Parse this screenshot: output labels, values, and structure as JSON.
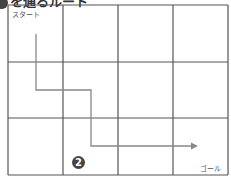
{
  "heading": {
    "text": "を通るルート"
  },
  "grid": {
    "cols": 4,
    "rows": 3,
    "x": [
      8,
      63,
      118,
      173,
      228
    ],
    "y": [
      5,
      62,
      118,
      175
    ],
    "line_color": "#555555"
  },
  "route": {
    "points": [
      [
        36,
        34
      ],
      [
        36,
        90
      ],
      [
        91,
        90
      ],
      [
        91,
        146
      ],
      [
        198,
        146
      ]
    ],
    "color": "#888888"
  },
  "labels": {
    "start": "スタート",
    "goal": "ゴール"
  },
  "badge": {
    "text": "2",
    "color": "#444444"
  }
}
